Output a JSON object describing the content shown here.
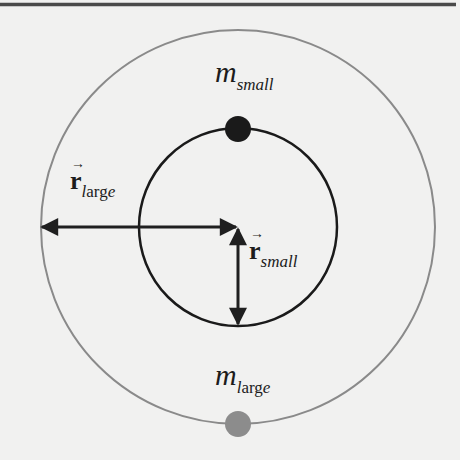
{
  "diagram": {
    "top_rule": {
      "color": "#4a4a4a"
    },
    "outer_orbit": {
      "cx": 238,
      "cy": 227,
      "r": 197,
      "color": "#8a8a8a"
    },
    "inner_orbit": {
      "cx": 238,
      "cy": 227,
      "r": 99,
      "color": "#1a1a1a"
    },
    "small_mass": {
      "cx": 238,
      "cy": 129,
      "r": 13,
      "color": "#1a1a1a"
    },
    "large_mass": {
      "cx": 238,
      "cy": 424,
      "r": 13,
      "color": "#8c8c8c"
    },
    "labels": {
      "m_small": {
        "main": "m",
        "sub": "small"
      },
      "r_large": {
        "main": "r",
        "vector": "→",
        "sub_l": "l",
        "sub_rest": "arg",
        "sub_e": "e"
      },
      "r_small": {
        "main": "r",
        "vector": "→",
        "sub": "small"
      },
      "m_large": {
        "main": "m",
        "sub_l": "l",
        "sub_rest": "arg",
        "sub_e": "e"
      }
    }
  }
}
